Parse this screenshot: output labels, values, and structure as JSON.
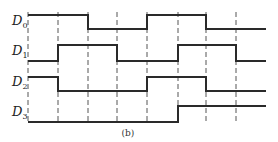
{
  "diagram": {
    "type": "timing-diagram",
    "caption": "(b)",
    "time_marks_x": [
      28,
      58,
      88,
      117,
      147,
      178,
      206,
      236,
      266
    ],
    "dashed_lines_x": [
      28,
      58,
      88,
      117,
      147,
      178,
      206,
      236
    ],
    "signals": [
      {
        "name": "D",
        "sub": "0",
        "label_y": 25,
        "high_y": 15,
        "low_y": 29,
        "levels": [
          1,
          1,
          0,
          0,
          1,
          1,
          0,
          0
        ]
      },
      {
        "name": "D",
        "sub": "1",
        "label_y": 55,
        "high_y": 45,
        "low_y": 61,
        "levels": [
          0,
          1,
          1,
          0,
          0,
          1,
          1,
          0
        ]
      },
      {
        "name": "D",
        "sub": "2",
        "label_y": 86,
        "high_y": 77,
        "low_y": 91,
        "levels": [
          1,
          0,
          0,
          0,
          1,
          1,
          0,
          0
        ]
      },
      {
        "name": "D",
        "sub": "3",
        "label_y": 116,
        "high_y": 106,
        "low_y": 122,
        "levels": [
          0,
          0,
          0,
          0,
          0,
          1,
          1,
          1
        ]
      }
    ]
  }
}
